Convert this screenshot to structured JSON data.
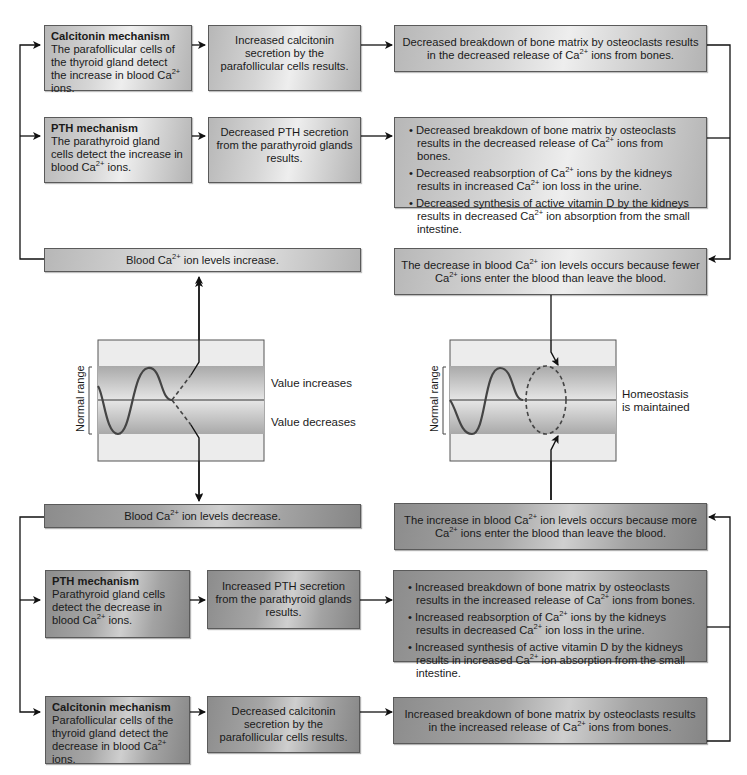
{
  "top": {
    "calcitonin_box": {
      "title": "Calcitonin mechanism",
      "text_pre": "The parafollicular cells of the thyroid gland detect the increase in blood Ca",
      "sup": "2+",
      "text_post": " ions."
    },
    "calcitonin_result": "Increased calcitonin secretion by the parafollicular cells results.",
    "calcitonin_effect": {
      "pre": "Decreased breakdown of bone matrix by osteoclasts results in the decreased release of Ca",
      "sup": "2+",
      "post": " ions from bones."
    },
    "pth_box": {
      "title": "PTH mechanism",
      "text_pre": "The parathyroid gland cells detect the increase in blood Ca",
      "sup": "2+",
      "text_post": " ions."
    },
    "pth_result": "Decreased PTH secretion from the parathyroid glands results.",
    "pth_effects": [
      {
        "pre": "Decreased breakdown of bone matrix by osteoclasts results in the decreased release of Ca",
        "sup": "2+",
        "mid": " ions from bones.",
        "sup2": "",
        "post": ""
      },
      {
        "pre": "Decreased reabsorption of Ca",
        "sup": "2+",
        "mid": " ions by the kidneys results in increased Ca",
        "sup2": "2+",
        "post": " ion loss in the urine."
      },
      {
        "pre": "Decreased synthesis of active vitamin D by the kidneys results in decreased Ca",
        "sup": "2+",
        "mid": " ion absorption from the small intestine.",
        "sup2": "",
        "post": ""
      }
    ],
    "stimulus": {
      "pre": "Blood Ca",
      "sup": "2+",
      "post": " ion levels increase."
    },
    "outcome": {
      "pre": "The decrease in blood Ca",
      "sup": "2+",
      "mid": " ion levels occurs because fewer Ca",
      "sup2": "2+",
      "post": " ions enter the blood than leave the blood."
    }
  },
  "graphs": {
    "left": {
      "range_label": "Normal range",
      "increase_label": "Value increases",
      "decrease_label": "Value decreases"
    },
    "right": {
      "range_label": "Normal range",
      "status_line1": "Homeostasis",
      "status_line2": "is maintained"
    }
  },
  "bottom": {
    "stimulus": {
      "pre": "Blood Ca",
      "sup": "2+",
      "post": " ion levels decrease."
    },
    "outcome": {
      "pre": "The increase in blood Ca",
      "sup": "2+",
      "mid": " ion levels occurs because more Ca",
      "sup2": "2+",
      "post": " ions enter the blood than leave the blood."
    },
    "pth_box": {
      "title": "PTH mechanism",
      "text_pre": "Parathyroid gland cells detect the decrease in blood Ca",
      "sup": "2+",
      "text_post": " ions."
    },
    "pth_result": "Increased PTH secretion from the parathyroid glands results.",
    "pth_effects": [
      {
        "pre": "Increased breakdown of bone matrix by osteoclasts results in the increased release of Ca",
        "sup": "2+",
        "mid": " ions from bones.",
        "sup2": "",
        "post": ""
      },
      {
        "pre": "Increased reabsorption of Ca",
        "sup": "2+",
        "mid": " ions by the kidneys results in decreased Ca",
        "sup2": "2+",
        "post": " ion loss in the urine."
      },
      {
        "pre": "Increased synthesis of active vitamin D by the kidneys results in increased Ca",
        "sup": "2+",
        "mid": " ion absorption from the small intestine.",
        "sup2": "",
        "post": ""
      }
    ],
    "calcitonin_box": {
      "title": "Calcitonin mechanism",
      "text_pre": "Parafollicular cells of the thyroid gland detect the decrease in blood Ca",
      "sup": "2+",
      "text_post": " ions."
    },
    "calcitonin_result": "Decreased calcitonin secretion by the parafollicular cells results.",
    "calcitonin_effect": {
      "pre": "Increased breakdown of bone matrix by osteoclasts results in the increased release of Ca",
      "sup": "2+",
      "post": " ions from bones."
    }
  }
}
